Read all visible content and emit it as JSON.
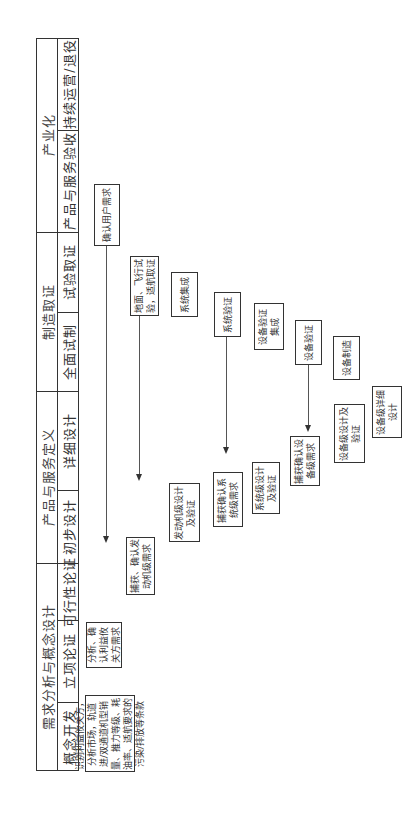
{
  "header": {
    "groups": [
      {
        "label": "产业化",
        "phases": [
          "持续运营/退役",
          "产品与服务验收"
        ]
      },
      {
        "label": "制造取证",
        "phases": [
          "试验取证",
          "全面试制"
        ]
      },
      {
        "label": "产品与服务定义",
        "phases": [
          "详细设计",
          "初步设计"
        ]
      },
      {
        "label": "需求分析与概念设计",
        "phases": [
          "可行性论证",
          "立项论证",
          "概念开发"
        ]
      }
    ]
  },
  "boxes": {
    "concept_dev": "识别利益攸关方，分析市场，轨道进/双通道机型销量、推力等级、耗油率、适航要求的污染/排放等条款",
    "project_demo": "分析、确认利益攸关方需求",
    "capture_engine": "捕获、确认发动机级需求",
    "engine_design": "发动机级设计及验证",
    "capture_system": "捕获确认系统级需求",
    "system_design": "系统级设计及验证",
    "capture_equipment": "捕获确认设备级需求",
    "equipment_design": "设备级设计及验证",
    "equipment_detail": "设备级详细设计",
    "equipment_mfg": "设备制造",
    "equipment_verify": "设备验证",
    "equipment_integration": "设备验证集成",
    "system_verify": "系统验证",
    "system_integration": "系统集成",
    "ground_flight_test": "地面、飞行试验，适航取证",
    "confirm_user_req": "确认用户需求"
  }
}
